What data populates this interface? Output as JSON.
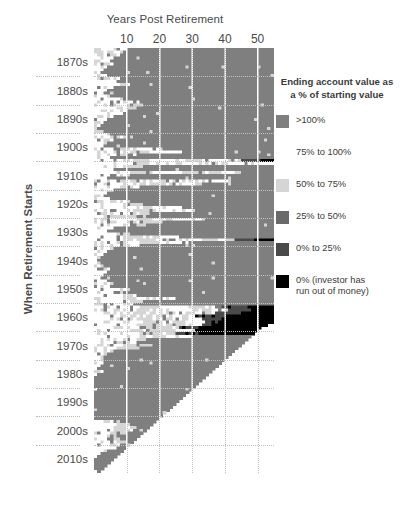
{
  "chart_data": {
    "type": "heatmap",
    "title": "",
    "xlabel": "Years Post Retirement",
    "ylabel": "When Retirement Starts",
    "xlim": [
      0,
      55
    ],
    "ylim_labels": [
      "1870s",
      "2010s"
    ],
    "x_ticks": [
      10,
      20,
      30,
      40,
      50
    ],
    "y_ticks": [
      "1870s",
      "1880s",
      "1890s",
      "1900s",
      "1910s",
      "1920s",
      "1930s",
      "1940s",
      "1950s",
      "1960s",
      "1970s",
      "1980s",
      "1990s",
      "2000s",
      "2010s"
    ],
    "grid": true,
    "legend_position": "right",
    "categories_legend": [
      ">100%",
      "75% to 100%",
      "50% to 75%",
      "25% to 50%",
      "0% to 25%",
      "0% (investor has run out of money)"
    ],
    "colors": [
      "#7f7f7f",
      "#ffffff",
      "#d5d5d5",
      "#6a6a6a",
      "#4a4a4a",
      "#000000"
    ],
    "note": "Each row is a retirement start year (1871-2015); each column is a year post retirement (1-55). Cell color encodes ending account value as a percent of starting value. Blank white triangle at lower right = data not yet available.",
    "x_years_min": 1,
    "x_years_max": 55,
    "start_year_min": 1871,
    "start_year_max": 2015,
    "data_cutoff_year": 2016,
    "rows": [
      {
        "start": 1871,
        "cells": "0:1:2,3:5:1,6:6:2,7:9:1,10:55:0"
      },
      {
        "start": 1872,
        "cells": "0:2:2,3:8:1,9:55:0"
      },
      {
        "start": 1873,
        "cells": "0:1:2,2:7:1,8:55:0"
      },
      {
        "start": 1874,
        "cells": "0:0:2,1:5:1,6:55:0"
      },
      {
        "start": 1875,
        "cells": "0:4:1,5:55:0"
      },
      {
        "start": 1876,
        "cells": "0:5:1,6:55:0"
      },
      {
        "start": 1877,
        "cells": "0:3:1,4:55:0"
      },
      {
        "start": 1878,
        "cells": "0:2:1,3:55:0"
      },
      {
        "start": 1879,
        "cells": "0:1:1,2:55:0"
      },
      {
        "start": 1880,
        "cells": "0:3:1,4:55:0"
      },
      {
        "start": 1881,
        "cells": "0:5:1,6:7:2,8:55:0"
      },
      {
        "start": 1882,
        "cells": "0:6:1,7:55:0"
      },
      {
        "start": 1883,
        "cells": "0:7:1,8:9:2,10:11:1,12:55:0"
      },
      {
        "start": 1884,
        "cells": "0:5:1,6:55:0"
      },
      {
        "start": 1885,
        "cells": "0:3:1,4:55:0"
      },
      {
        "start": 1886,
        "cells": "0:2:1,3:55:0"
      },
      {
        "start": 1887,
        "cells": "0:4:1,5:55:0"
      },
      {
        "start": 1888,
        "cells": "0:6:1,7:8:2,9:55:0"
      },
      {
        "start": 1889,
        "cells": "0:8:1,9:11:2,12:13:1,14:55:0"
      },
      {
        "start": 1890,
        "cells": "0:9:1,10:14:2,15:55:0"
      },
      {
        "start": 1891,
        "cells": "0:7:1,8:12:2,13:55:0"
      },
      {
        "start": 1892,
        "cells": "0:6:1,7:10:2,11:55:0"
      },
      {
        "start": 1893,
        "cells": "0:8:1,9:55:0"
      },
      {
        "start": 1894,
        "cells": "0:5:1,6:55:0"
      },
      {
        "start": 1895,
        "cells": "0:3:1,4:55:0"
      },
      {
        "start": 1896,
        "cells": "0:2:1,3:55:0"
      },
      {
        "start": 1897,
        "cells": "0:1:1,2:55:0"
      },
      {
        "start": 1898,
        "cells": "0:0:1,1:55:0"
      },
      {
        "start": 1899,
        "cells": "0:2:1,3:55:0"
      },
      {
        "start": 1900,
        "cells": "0:4:1,5:55:0"
      },
      {
        "start": 1901,
        "cells": "0:6:1,7:9:2,10:55:0"
      },
      {
        "start": 1902,
        "cells": "0:5:1,6:55:0"
      },
      {
        "start": 1903,
        "cells": "0:3:1,4:55:0"
      },
      {
        "start": 1904,
        "cells": "0:2:1,3:55:0"
      },
      {
        "start": 1905,
        "cells": "0:7:1,8:14:2,15:20:1,21:55:0"
      },
      {
        "start": 1906,
        "cells": "0:9:1,10:18:2,19:26:1,27:55:0"
      },
      {
        "start": 1907,
        "cells": "0:6:1,7:12:2,13:55:0"
      },
      {
        "start": 1908,
        "cells": "0:4:1,5:55:0"
      },
      {
        "start": 1909,
        "cells": "0:8:1,9:16:2,17:24:1,25:35:2,36:44:1,45:50:4,51:55:5"
      },
      {
        "start": 1910,
        "cells": "0:10:1,11:20:2,21:30:1,31:40:2,41:55:1"
      },
      {
        "start": 1911,
        "cells": "0:7:1,8:14:2,15:55:0"
      },
      {
        "start": 1912,
        "cells": "0:5:1,6:55:0"
      },
      {
        "start": 1913,
        "cells": "0:9:1,10:17:2,18:28:1,29:38:2,39:44:1,45:55:0"
      },
      {
        "start": 1914,
        "cells": "0:6:1,7:11:2,12:55:0"
      },
      {
        "start": 1915,
        "cells": "0:4:1,5:55:0"
      },
      {
        "start": 1916,
        "cells": "0:8:1,9:15:2,16:23:1,24:33:2,34:41:1,42:55:0"
      },
      {
        "start": 1917,
        "cells": "0:11:1,12:22:2,23:31:1,32:55:0"
      },
      {
        "start": 1918,
        "cells": "0:7:1,8:13:2,14:55:0"
      },
      {
        "start": 1919,
        "cells": "0:5:1,6:55:0"
      },
      {
        "start": 1920,
        "cells": "0:3:1,4:55:0"
      },
      {
        "start": 1921,
        "cells": "0:2:1,3:55:0"
      },
      {
        "start": 1922,
        "cells": "0:4:1,5:55:0"
      },
      {
        "start": 1923,
        "cells": "0:6:1,7:10:2,11:55:0"
      },
      {
        "start": 1924,
        "cells": "0:8:1,9:14:2,15:55:0"
      },
      {
        "start": 1925,
        "cells": "0:10:1,11:18:2,19:26:1,27:55:0"
      },
      {
        "start": 1926,
        "cells": "0:12:1,13:22:2,23:30:1,31:55:0"
      },
      {
        "start": 1927,
        "cells": "0:9:1,10:16:2,17:55:0"
      },
      {
        "start": 1928,
        "cells": "0:7:1,8:12:2,13:55:0"
      },
      {
        "start": 1929,
        "cells": "0:13:1,14:24:2,25:33:1,34:55:0"
      },
      {
        "start": 1930,
        "cells": "0:11:1,12:20:2,21:55:0"
      },
      {
        "start": 1931,
        "cells": "0:8:1,9:15:2,16:55:0"
      },
      {
        "start": 1932,
        "cells": "0:5:1,6:55:0"
      },
      {
        "start": 1933,
        "cells": "0:3:1,4:55:0"
      },
      {
        "start": 1934,
        "cells": "0:6:1,7:11:2,12:55:0"
      },
      {
        "start": 1935,
        "cells": "0:9:1,10:17:2,18:25:1,26:55:0"
      },
      {
        "start": 1936,
        "cells": "0:12:1,13:23:2,24:32:1,33:42:2,43:48:4,49:55:5"
      },
      {
        "start": 1937,
        "cells": "0:10:1,11:19:2,20:28:1,29:55:0"
      },
      {
        "start": 1938,
        "cells": "0:7:1,8:13:2,14:55:0"
      },
      {
        "start": 1939,
        "cells": "0:5:1,6:55:0"
      },
      {
        "start": 1940,
        "cells": "0:3:1,4:55:0"
      },
      {
        "start": 1941,
        "cells": "0:2:1,3:55:0"
      },
      {
        "start": 1942,
        "cells": "0:1:1,2:55:0"
      },
      {
        "start": 1943,
        "cells": "0:0:1,1:55:0"
      },
      {
        "start": 1944,
        "cells": "0:1:1,2:55:0"
      },
      {
        "start": 1945,
        "cells": "0:2:1,3:55:0"
      },
      {
        "start": 1946,
        "cells": "0:4:1,5:55:0"
      },
      {
        "start": 1947,
        "cells": "0:3:1,4:55:0"
      },
      {
        "start": 1948,
        "cells": "0:2:1,3:55:0"
      },
      {
        "start": 1949,
        "cells": "0:1:1,2:55:0"
      },
      {
        "start": 1950,
        "cells": "0:3:1,4:55:0"
      },
      {
        "start": 1951,
        "cells": "0:5:1,6:55:0"
      },
      {
        "start": 1952,
        "cells": "0:4:1,5:55:0"
      },
      {
        "start": 1953,
        "cells": "0:6:1,7:10:2,11:55:0"
      },
      {
        "start": 1954,
        "cells": "0:5:1,6:55:0"
      },
      {
        "start": 1955,
        "cells": "0:7:1,8:12:2,13:55:0"
      },
      {
        "start": 1956,
        "cells": "0:9:1,10:16:2,17:24:1,25:55:0"
      },
      {
        "start": 1957,
        "cells": "0:8:1,9:14:2,15:55:0"
      },
      {
        "start": 1958,
        "cells": "0:6:1,7:11:2,12:55:0"
      },
      {
        "start": 1959,
        "cells": "0:10:1,11:19:2,20:28:1,29:38:2,39:46:4,47:55:5"
      },
      {
        "start": 1960,
        "cells": "0:12:1,13:22:2,23:31:1,32:40:2,41:47:4,48:55:5"
      },
      {
        "start": 1961,
        "cells": "0:9:1,10:17:2,18:26:1,27:36:2,37:44:4,45:55:5"
      },
      {
        "start": 1962,
        "cells": "0:11:1,12:21:2,22:30:1,31:39:4,40:55:5"
      },
      {
        "start": 1963,
        "cells": "0:13:1,14:24:2,25:32:1,33:38:4,39:55:5"
      },
      {
        "start": 1964,
        "cells": "0:14:1,15:25:2,26:33:1,34:37:4,38:55:5"
      },
      {
        "start": 1965,
        "cells": "0:15:1,16:26:2,27:32:1,33:36:4,37:52:5,53:55:-1"
      },
      {
        "start": 1966,
        "cells": "0:14:1,15:25:2,26:31:4,32:50:5,51:55:-1"
      },
      {
        "start": 1967,
        "cells": "0:12:1,13:23:2,24:30:1,31:49:5,50:55:-1"
      },
      {
        "start": 1968,
        "cells": "0:13:1,14:24:2,25:31:4,32:48:5,49:55:-1"
      },
      {
        "start": 1969,
        "cells": "0:11:1,12:21:2,22:29:1,30:47:0,48:55:-1"
      },
      {
        "start": 1970,
        "cells": "0:8:1,9:15:2,16:46:0,47:55:-1"
      },
      {
        "start": 1971,
        "cells": "0:6:1,7:12:2,13:45:0,46:55:-1"
      },
      {
        "start": 1972,
        "cells": "0:9:1,10:17:2,18:44:0,45:55:-1"
      },
      {
        "start": 1973,
        "cells": "0:7:1,8:13:2,14:43:0,44:55:-1"
      },
      {
        "start": 1974,
        "cells": "0:5:1,6:42:0,43:55:-1"
      },
      {
        "start": 1975,
        "cells": "0:3:1,4:41:0,42:55:-1"
      },
      {
        "start": 1976,
        "cells": "0:2:1,3:40:0,41:55:-1"
      },
      {
        "start": 1977,
        "cells": "0:4:1,5:39:0,40:55:-1"
      },
      {
        "start": 1978,
        "cells": "0:2:1,3:38:0,39:55:-1"
      },
      {
        "start": 1979,
        "cells": "0:1:1,2:37:0,38:55:-1"
      },
      {
        "start": 1980,
        "cells": "0:0:1,1:36:0,37:55:-1"
      },
      {
        "start": 1981,
        "cells": "0:2:1,3:35:0,36:55:-1"
      },
      {
        "start": 1982,
        "cells": "0:0:1,1:34:0,35:55:-1"
      },
      {
        "start": 1983,
        "cells": "0:33:0,34:55:-1"
      },
      {
        "start": 1984,
        "cells": "0:32:0,33:55:-1"
      },
      {
        "start": 1985,
        "cells": "0:31:0,32:55:-1"
      },
      {
        "start": 1986,
        "cells": "0:30:0,31:55:-1"
      },
      {
        "start": 1987,
        "cells": "0:1:1,2:29:0,30:55:-1"
      },
      {
        "start": 1988,
        "cells": "0:28:0,29:55:-1"
      },
      {
        "start": 1989,
        "cells": "0:27:0,28:55:-1"
      },
      {
        "start": 1990,
        "cells": "0:26:0,27:55:-1"
      },
      {
        "start": 1991,
        "cells": "0:25:0,26:55:-1"
      },
      {
        "start": 1992,
        "cells": "0:24:0,25:55:-1"
      },
      {
        "start": 1993,
        "cells": "0:23:0,24:55:-1"
      },
      {
        "start": 1994,
        "cells": "0:22:0,23:55:-1"
      },
      {
        "start": 1995,
        "cells": "0:21:0,22:55:-1"
      },
      {
        "start": 1996,
        "cells": "0:20:0,21:55:-1"
      },
      {
        "start": 1997,
        "cells": "0:19:0,20:55:-1"
      },
      {
        "start": 1998,
        "cells": "0:3:1,4:7:2,8:18:0,19:55:-1"
      },
      {
        "start": 1999,
        "cells": "0:5:1,6:10:2,11:17:0,18:55:-1"
      },
      {
        "start": 2000,
        "cells": "0:7:1,8:12:2,13:16:0,17:55:-1"
      },
      {
        "start": 2001,
        "cells": "0:6:1,7:11:2,12:15:0,16:55:-1"
      },
      {
        "start": 2002,
        "cells": "0:4:1,5:9:2,10:14:0,15:55:-1"
      },
      {
        "start": 2003,
        "cells": "0:2:1,3:6:2,7:13:0,14:55:-1"
      },
      {
        "start": 2004,
        "cells": "0:3:1,4:7:2,8:12:0,13:55:-1"
      },
      {
        "start": 2005,
        "cells": "0:5:1,6:9:2,10:11:0,12:55:-1"
      },
      {
        "start": 2006,
        "cells": "0:4:1,5:8:2,9:10:0,11:55:-1"
      },
      {
        "start": 2007,
        "cells": "0:6:1,7:9:0,10:55:-1"
      },
      {
        "start": 2008,
        "cells": "0:3:1,4:8:0,9:55:-1"
      },
      {
        "start": 2009,
        "cells": "0:1:1,2:7:0,8:55:-1"
      },
      {
        "start": 2010,
        "cells": "0:0:1,1:6:0,7:55:-1"
      },
      {
        "start": 2011,
        "cells": "0:5:0,6:55:-1"
      },
      {
        "start": 2012,
        "cells": "0:4:0,5:55:-1"
      },
      {
        "start": 2013,
        "cells": "0:3:0,4:55:-1"
      },
      {
        "start": 2014,
        "cells": "0:2:0,3:55:-1"
      },
      {
        "start": 2015,
        "cells": "0:1:1,1:1:0,2:55:-1"
      }
    ]
  },
  "axes": {
    "x_title": "Years Post Retirement",
    "y_title": "When Retirement Starts",
    "x_tick_labels": [
      "10",
      "20",
      "30",
      "40",
      "50"
    ],
    "y_tick_labels": [
      "1870s",
      "1880s",
      "1890s",
      "1900s",
      "1910s",
      "1920s",
      "1930s",
      "1940s",
      "1950s",
      "1960s",
      "1970s",
      "1980s",
      "1990s",
      "2000s",
      "2010s"
    ]
  },
  "legend": {
    "title_line1": "Ending account value as",
    "title_line2": "a % of starting value",
    "entries": [
      {
        "label": ">100%",
        "color": "#7f7f7f",
        "show_swatch": true
      },
      {
        "label": "75% to 100%",
        "color": "#ffffff",
        "show_swatch": false
      },
      {
        "label": "50% to 75%",
        "color": "#d5d5d5",
        "show_swatch": true
      },
      {
        "label": "25% to 50%",
        "color": "#6a6a6a",
        "show_swatch": true
      },
      {
        "label": "0% to 25%",
        "color": "#4a4a4a",
        "show_swatch": true
      },
      {
        "label_line1": "0% (investor has",
        "label_line2": "run out of money)",
        "label": "0% (investor has run out of money)",
        "color": "#000000",
        "show_swatch": true
      }
    ]
  },
  "colors": {
    "background": "#ffffff",
    "text": "#4a4a4a",
    "gridline_white": "#ffffff",
    "gridline_dotted": "#c2c2c2"
  }
}
